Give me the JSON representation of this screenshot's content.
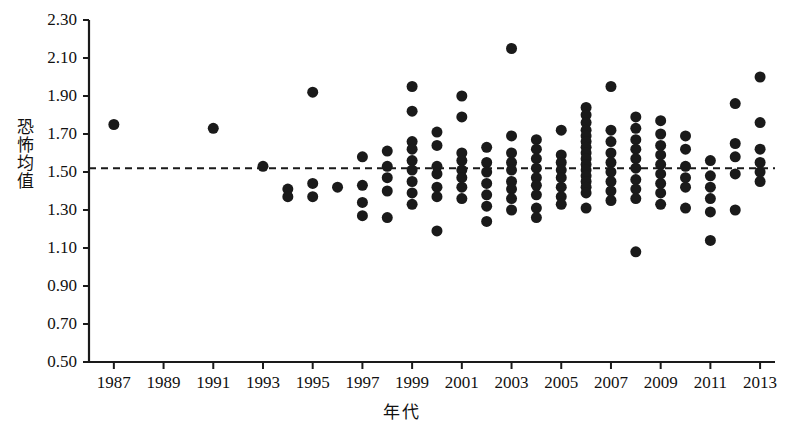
{
  "chart_data": {
    "type": "scatter",
    "title": "",
    "xlabel": "年代",
    "ylabel": "恐怖均值",
    "xlim": [
      1986,
      2013.6
    ],
    "ylim": [
      0.5,
      2.3
    ],
    "xticks": [
      1987,
      1989,
      1991,
      1993,
      1995,
      1997,
      1999,
      2001,
      2003,
      2005,
      2007,
      2009,
      2011,
      2013
    ],
    "xtick_labels": [
      "1987",
      "1989",
      "1991",
      "1993",
      "1995",
      "1997",
      "1999",
      "2001",
      "2003",
      "2005",
      "2007",
      "2009",
      "2011",
      "2013"
    ],
    "yticks": [
      0.5,
      0.7,
      0.9,
      1.1,
      1.3,
      1.5,
      1.7,
      1.9,
      2.1,
      2.3
    ],
    "ytick_labels": [
      "0.50",
      "0.70",
      "0.90",
      "1.10",
      "1.30",
      "1.50",
      "1.70",
      "1.90",
      "2.10",
      "2.30"
    ],
    "grid": false,
    "legend": false,
    "marker": "filled-circle",
    "marker_color": "#1a1a1a",
    "marker_size_px": 11,
    "reference_line": {
      "type": "horizontal-dashed",
      "value": 1.52,
      "color": "#1a1a1a",
      "style": "dashed"
    },
    "point_count": 164,
    "points": [
      [
        1987,
        1.75
      ],
      [
        1991,
        1.73
      ],
      [
        1993,
        1.53
      ],
      [
        1994,
        1.41
      ],
      [
        1994,
        1.37
      ],
      [
        1995,
        1.92
      ],
      [
        1995,
        1.44
      ],
      [
        1995,
        1.37
      ],
      [
        1996,
        1.42
      ],
      [
        1997,
        1.58
      ],
      [
        1997,
        1.43
      ],
      [
        1997,
        1.34
      ],
      [
        1997,
        1.27
      ],
      [
        1998,
        1.61
      ],
      [
        1998,
        1.53
      ],
      [
        1998,
        1.47
      ],
      [
        1998,
        1.4
      ],
      [
        1998,
        1.26
      ],
      [
        1999,
        1.95
      ],
      [
        1999,
        1.82
      ],
      [
        1999,
        1.66
      ],
      [
        1999,
        1.62
      ],
      [
        1999,
        1.56
      ],
      [
        1999,
        1.51
      ],
      [
        1999,
        1.45
      ],
      [
        1999,
        1.39
      ],
      [
        1999,
        1.33
      ],
      [
        2000,
        1.71
      ],
      [
        2000,
        1.64
      ],
      [
        2000,
        1.53
      ],
      [
        2000,
        1.49
      ],
      [
        2000,
        1.42
      ],
      [
        2000,
        1.37
      ],
      [
        2000,
        1.19
      ],
      [
        2001,
        1.9
      ],
      [
        2001,
        1.79
      ],
      [
        2001,
        1.6
      ],
      [
        2001,
        1.56
      ],
      [
        2001,
        1.51
      ],
      [
        2001,
        1.47
      ],
      [
        2001,
        1.42
      ],
      [
        2001,
        1.36
      ],
      [
        2002,
        1.63
      ],
      [
        2002,
        1.55
      ],
      [
        2002,
        1.5
      ],
      [
        2002,
        1.44
      ],
      [
        2002,
        1.38
      ],
      [
        2002,
        1.32
      ],
      [
        2002,
        1.24
      ],
      [
        2003,
        2.15
      ],
      [
        2003,
        1.69
      ],
      [
        2003,
        1.6
      ],
      [
        2003,
        1.55
      ],
      [
        2003,
        1.51
      ],
      [
        2003,
        1.45
      ],
      [
        2003,
        1.41
      ],
      [
        2003,
        1.36
      ],
      [
        2003,
        1.3
      ],
      [
        2004,
        1.67
      ],
      [
        2004,
        1.62
      ],
      [
        2004,
        1.57
      ],
      [
        2004,
        1.52
      ],
      [
        2004,
        1.47
      ],
      [
        2004,
        1.43
      ],
      [
        2004,
        1.38
      ],
      [
        2004,
        1.31
      ],
      [
        2004,
        1.26
      ],
      [
        2005,
        1.72
      ],
      [
        2005,
        1.59
      ],
      [
        2005,
        1.55
      ],
      [
        2005,
        1.51
      ],
      [
        2005,
        1.47
      ],
      [
        2005,
        1.42
      ],
      [
        2005,
        1.37
      ],
      [
        2005,
        1.33
      ],
      [
        2006,
        1.84
      ],
      [
        2006,
        1.8
      ],
      [
        2006,
        1.76
      ],
      [
        2006,
        1.72
      ],
      [
        2006,
        1.69
      ],
      [
        2006,
        1.66
      ],
      [
        2006,
        1.63
      ],
      [
        2006,
        1.6
      ],
      [
        2006,
        1.57
      ],
      [
        2006,
        1.54
      ],
      [
        2006,
        1.51
      ],
      [
        2006,
        1.48
      ],
      [
        2006,
        1.45
      ],
      [
        2006,
        1.42
      ],
      [
        2006,
        1.39
      ],
      [
        2006,
        1.31
      ],
      [
        2007,
        1.95
      ],
      [
        2007,
        1.72
      ],
      [
        2007,
        1.66
      ],
      [
        2007,
        1.6
      ],
      [
        2007,
        1.55
      ],
      [
        2007,
        1.5
      ],
      [
        2007,
        1.45
      ],
      [
        2007,
        1.4
      ],
      [
        2007,
        1.35
      ],
      [
        2008,
        1.79
      ],
      [
        2008,
        1.73
      ],
      [
        2008,
        1.67
      ],
      [
        2008,
        1.62
      ],
      [
        2008,
        1.57
      ],
      [
        2008,
        1.52
      ],
      [
        2008,
        1.46
      ],
      [
        2008,
        1.41
      ],
      [
        2008,
        1.36
      ],
      [
        2008,
        1.08
      ],
      [
        2009,
        1.77
      ],
      [
        2009,
        1.7
      ],
      [
        2009,
        1.64
      ],
      [
        2009,
        1.59
      ],
      [
        2009,
        1.54
      ],
      [
        2009,
        1.49
      ],
      [
        2009,
        1.44
      ],
      [
        2009,
        1.39
      ],
      [
        2009,
        1.33
      ],
      [
        2010,
        1.69
      ],
      [
        2010,
        1.62
      ],
      [
        2010,
        1.53
      ],
      [
        2010,
        1.47
      ],
      [
        2010,
        1.42
      ],
      [
        2010,
        1.31
      ],
      [
        2011,
        1.56
      ],
      [
        2011,
        1.48
      ],
      [
        2011,
        1.42
      ],
      [
        2011,
        1.36
      ],
      [
        2011,
        1.29
      ],
      [
        2011,
        1.14
      ],
      [
        2012,
        1.86
      ],
      [
        2012,
        1.65
      ],
      [
        2012,
        1.58
      ],
      [
        2012,
        1.49
      ],
      [
        2012,
        1.3
      ],
      [
        2013,
        2.0
      ],
      [
        2013,
        1.76
      ],
      [
        2013,
        1.62
      ],
      [
        2013,
        1.55
      ],
      [
        2013,
        1.5
      ],
      [
        2013,
        1.45
      ]
    ]
  },
  "axes": {
    "y_axis_name": "y-axis",
    "x_axis_name": "x-axis"
  }
}
